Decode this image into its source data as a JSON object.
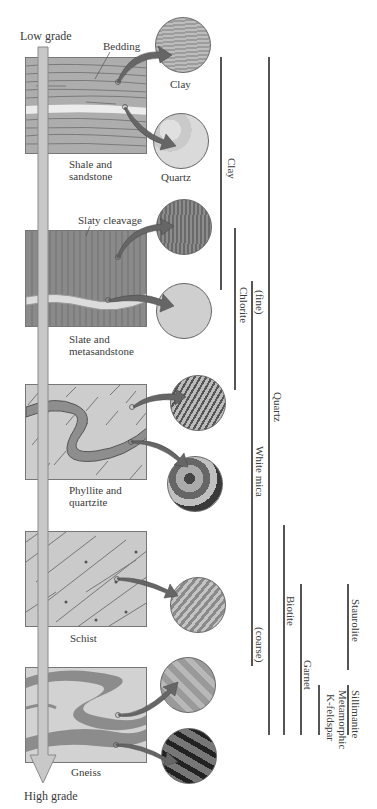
{
  "diagram": {
    "arrow": {
      "top_label": "Low grade",
      "bottom_label": "High grade"
    },
    "rocks": [
      {
        "name": "Shale and sandstone",
        "line1": "Shale and",
        "line2": "sandstone",
        "callout": "Bedding",
        "minerals_shown": [
          "Clay",
          "Quartz"
        ]
      },
      {
        "name": "Slate and metasandstone",
        "line1": "Slate and",
        "line2": "metasandstone",
        "callout": "Slaty cleavage"
      },
      {
        "name": "Phyllite and quartzite",
        "line1": "Phyllite and",
        "line2": "quartzite"
      },
      {
        "name": "Schist",
        "line1": "Schist",
        "line2": ""
      },
      {
        "name": "Gneiss",
        "line1": "Gneiss",
        "line2": ""
      }
    ],
    "circle_labels": {
      "clay": "Clay",
      "quartz": "Quartz"
    },
    "mineral_ranges": [
      {
        "name": "Clay",
        "label": "Clay"
      },
      {
        "name": "Quartz",
        "label": "Quartz"
      },
      {
        "name": "Chlorite",
        "label": "Chlorite"
      },
      {
        "name": "White mica",
        "label": "White mica",
        "fine": "(fine)",
        "coarse": "(coarse)"
      },
      {
        "name": "Biotite",
        "label": "Biotite"
      },
      {
        "name": "Garnet",
        "label": "Garnet"
      },
      {
        "name": "Staurolite",
        "label": "Staurolite"
      },
      {
        "name": "Sillimanite",
        "label": "Sillimanite"
      },
      {
        "name": "Metamorphic K-feldspar",
        "label1": "Metamorphic",
        "label2": "K-feldspar"
      }
    ],
    "colors": {
      "arrow_fill": "#c8c8c8",
      "block_shale": "#b0b0b0",
      "block_slate": "#8a8a8a",
      "block_light": "#cfcfcf",
      "callout_arrow": "#666666",
      "range_line": "#555555"
    }
  }
}
